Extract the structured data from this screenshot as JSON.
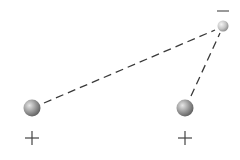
{
  "diagram": {
    "charges": [
      {
        "id": "left-positive",
        "sign": "+",
        "cx": 32,
        "cy": 108,
        "r": 8.5
      },
      {
        "id": "right-positive",
        "sign": "+",
        "cx": 185,
        "cy": 108,
        "r": 8.5
      },
      {
        "id": "top-negative",
        "sign": "−",
        "cx": 223,
        "cy": 26,
        "r": 5.5
      }
    ],
    "labels": {
      "left_sign": "+",
      "right_sign": "+",
      "top_sign": "−"
    },
    "colors": {
      "line": "#333333",
      "sphere_light": "#e8e8e8",
      "sphere_dark": "#6a6a6a"
    }
  }
}
